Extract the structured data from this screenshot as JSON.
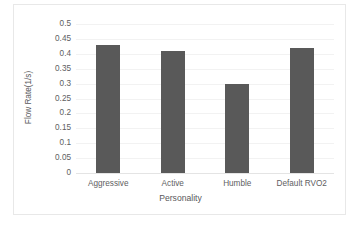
{
  "chart_data": {
    "type": "bar",
    "title": "",
    "xlabel": "Personality",
    "ylabel": "Flow Rate(1/s)",
    "categories": [
      "Aggressive",
      "Active",
      "Humble",
      "Default RVO2"
    ],
    "values": [
      0.428,
      0.408,
      0.3,
      0.418
    ],
    "series": [
      {
        "name": "Flow Rate",
        "values": [
          0.428,
          0.408,
          0.3,
          0.418
        ]
      }
    ],
    "ylim": [
      0,
      0.5
    ],
    "ytick_labels": [
      "0",
      "0.05",
      "0.1",
      "0.15",
      "0.2",
      "0.25",
      "0.3",
      "0.35",
      "0.4",
      "0.45",
      "0.5"
    ],
    "ytick_values": [
      0,
      0.05,
      0.1,
      0.15,
      0.2,
      0.25,
      0.3,
      0.35,
      0.4,
      0.45,
      0.5
    ],
    "grid": true,
    "legend": false,
    "legend_position": "none",
    "bar_color": "#595959",
    "gridline_color": "#f2f2f2",
    "text_color": "#5e5e61",
    "border_color": "#e8e8e8",
    "background": "#ffffff"
  }
}
